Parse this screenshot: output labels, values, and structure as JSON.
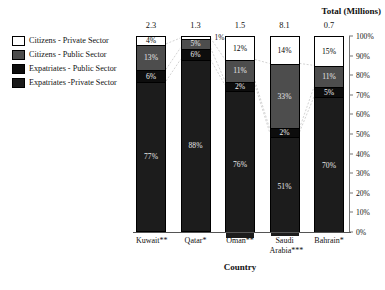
{
  "chart_data": {
    "type": "bar",
    "subtype": "stacked-100-percent",
    "title": "",
    "xlabel": "Country",
    "ylabel": "",
    "ylim": [
      0,
      100
    ],
    "ytick_labels": [
      "100%",
      "90%",
      "80%",
      "70%",
      "60%",
      "50%",
      "40%",
      "30%",
      "20%",
      "10%",
      "0%"
    ],
    "ytick_values": [
      100,
      90,
      80,
      70,
      60,
      50,
      40,
      30,
      20,
      10,
      0
    ],
    "grid": false,
    "legend_position": "left",
    "categories": [
      "Kuwait**",
      "Qatar*",
      "Oman**",
      "Saudi Arabia***",
      "Bahrain*"
    ],
    "series": [
      {
        "name": "Citizens - Private Sector",
        "values": [
          4,
          1,
          12,
          14,
          15
        ]
      },
      {
        "name": "Citizens - Public Sector",
        "values": [
          13,
          5,
          11,
          33,
          11
        ]
      },
      {
        "name": "Expatriates - Public Sector",
        "values": [
          6,
          6,
          2,
          2,
          5
        ]
      },
      {
        "name": "Expatriates -Private Sector",
        "values": [
          77,
          88,
          76,
          51,
          70
        ]
      }
    ],
    "totals_header": "Total (Millions)",
    "totals": [
      "2.3",
      "1.3",
      "1.5",
      "8.1",
      "0.7"
    ],
    "annotations": [
      {
        "text": "1%",
        "series": "Citizens - Private Sector",
        "category": "Qatar*",
        "placement": "outside-right"
      }
    ]
  },
  "legend": {
    "items": [
      {
        "label": "Citizens - Private Sector",
        "swatch": "swatch-white",
        "color": "#ffffff"
      },
      {
        "label": "Citizens - Public Sector",
        "swatch": "swatch-mid-gray",
        "color": "#4d4d4d"
      },
      {
        "label": "Expatriates - Public Sector",
        "swatch": "swatch-near-black",
        "color": "#0d0d0d"
      },
      {
        "label": "Expatriates -Private Sector",
        "swatch": "swatch-dark-gray",
        "color": "#1c1c1c"
      }
    ]
  },
  "bars": [
    {
      "category": "Kuwait**",
      "total": "2.3",
      "segments": [
        {
          "label": "4%",
          "value": 4,
          "series": "Citizens - Private Sector"
        },
        {
          "label": "13%",
          "value": 13,
          "series": "Citizens - Public Sector"
        },
        {
          "label": "6%",
          "value": 6,
          "series": "Expatriates - Public Sector"
        },
        {
          "label": "77%",
          "value": 77,
          "series": "Expatriates -Private Sector"
        }
      ]
    },
    {
      "category": "Qatar*",
      "total": "1.3",
      "segments": [
        {
          "label": "1%",
          "value": 1,
          "series": "Citizens - Private Sector"
        },
        {
          "label": "5%",
          "value": 5,
          "series": "Citizens - Public Sector"
        },
        {
          "label": "6%",
          "value": 6,
          "series": "Expatriates - Public Sector"
        },
        {
          "label": "88%",
          "value": 88,
          "series": "Expatriates -Private Sector"
        }
      ]
    },
    {
      "category": "Oman**",
      "total": "1.5",
      "segments": [
        {
          "label": "12%",
          "value": 12,
          "series": "Citizens - Private Sector"
        },
        {
          "label": "11%",
          "value": 11,
          "series": "Citizens - Public Sector"
        },
        {
          "label": "2%",
          "value": 2,
          "series": "Expatriates - Public Sector"
        },
        {
          "label": "76%",
          "value": 76,
          "series": "Expatriates -Private Sector"
        }
      ]
    },
    {
      "category": "Saudi Arabia***",
      "total": "8.1",
      "segments": [
        {
          "label": "14%",
          "value": 14,
          "series": "Citizens - Private Sector"
        },
        {
          "label": "33%",
          "value": 33,
          "series": "Citizens - Public Sector"
        },
        {
          "label": "2%",
          "value": 2,
          "series": "Expatriates - Public Sector"
        },
        {
          "label": "51%",
          "value": 51,
          "series": "Expatriates -Private Sector"
        }
      ]
    },
    {
      "category": "Bahrain*",
      "total": "0.7",
      "segments": [
        {
          "label": "15%",
          "value": 15,
          "series": "Citizens - Private Sector"
        },
        {
          "label": "11%",
          "value": 11,
          "series": "Citizens - Public Sector"
        },
        {
          "label": "5%",
          "value": 5,
          "series": "Expatriates - Public Sector"
        },
        {
          "label": "70%",
          "value": 70,
          "series": "Expatriates -Private Sector"
        }
      ]
    }
  ],
  "xaxis": {
    "title": "Country",
    "labels": [
      {
        "lines": [
          "Kuwait**"
        ]
      },
      {
        "lines": [
          "Qatar*"
        ]
      },
      {
        "lines": [
          "Oman**"
        ]
      },
      {
        "lines": [
          "Saudi",
          "Arabia***"
        ]
      },
      {
        "lines": [
          "Bahrain*"
        ]
      }
    ]
  },
  "totals_header": "Total (Millions)",
  "colors": {
    "citizens_private": "#ffffff",
    "citizens_public": "#4d4d4d",
    "expatriates_public": "#0d0d0d",
    "expatriates_private": "#1c1c1c",
    "axis": "#777777",
    "connector": "#b5b5b5"
  }
}
